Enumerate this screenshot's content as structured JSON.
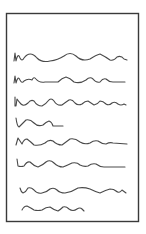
{
  "figure": {
    "frame": {
      "x": 6,
      "y": 13,
      "width": 133,
      "height": 209,
      "stroke": "#3a3a3a"
    },
    "line_color": "#4a4a4a",
    "lines": [
      {
        "id": 1,
        "y": 58,
        "x_start": 14,
        "x_end": 127,
        "length": "full"
      },
      {
        "id": 2,
        "y": 80,
        "x_start": 14,
        "x_end": 125,
        "length": "full"
      },
      {
        "id": 3,
        "y": 103,
        "x_start": 15,
        "x_end": 126,
        "length": "full"
      },
      {
        "id": 4,
        "y": 124,
        "x_start": 16,
        "x_end": 63,
        "length": "short"
      },
      {
        "id": 5,
        "y": 142,
        "x_start": 16,
        "x_end": 127,
        "length": "full"
      },
      {
        "id": 6,
        "y": 164,
        "x_start": 17,
        "x_end": 125,
        "length": "full"
      },
      {
        "id": 7,
        "y": 190,
        "x_start": 20,
        "x_end": 126,
        "length": "full"
      },
      {
        "id": 8,
        "y": 207,
        "x_start": 22,
        "x_end": 84,
        "length": "short"
      }
    ]
  }
}
